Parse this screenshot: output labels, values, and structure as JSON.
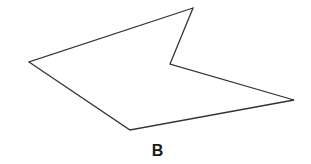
{
  "figure": {
    "label": "B",
    "shape": "concave-pentagon",
    "stroke_color": "#333333",
    "fill_color": "#ffffff",
    "vertices": [
      [
        193,
        8
      ],
      [
        29,
        62
      ],
      [
        130,
        130
      ],
      [
        294,
        100
      ],
      [
        170,
        64
      ]
    ]
  }
}
